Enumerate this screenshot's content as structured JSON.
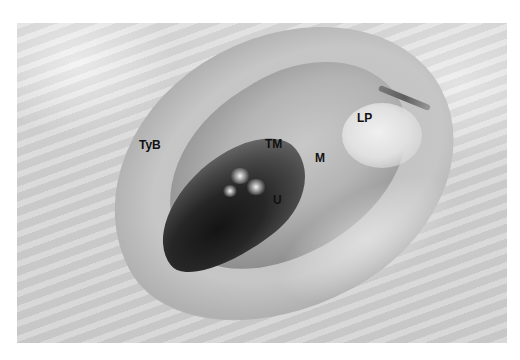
{
  "figure": {
    "labels": {
      "tyb": "TyB",
      "tm": "TM",
      "m": "M",
      "u": "U",
      "lp": "LP"
    }
  },
  "colors": {
    "background": "#ffffff",
    "label": "#111111"
  }
}
